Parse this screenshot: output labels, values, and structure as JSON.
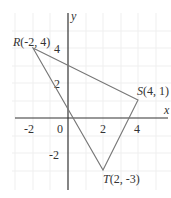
{
  "diagram": {
    "type": "coordinate-plane-triangle",
    "axes": {
      "x_label": "x",
      "y_label": "y",
      "origin_label": "0",
      "x_ticks": [
        "-2",
        "2",
        "4"
      ],
      "y_ticks": [
        "4",
        "2",
        "-2"
      ]
    },
    "points": [
      {
        "name": "R",
        "coords": "(-2, 4)",
        "x": -2,
        "y": 4
      },
      {
        "name": "S",
        "coords": "(4, 1)",
        "x": 4,
        "y": 1
      },
      {
        "name": "T",
        "coords": "(2, -3)",
        "x": 2,
        "y": -3
      }
    ],
    "colors": {
      "axis": "#333333",
      "triangle": "#777777",
      "grid": "#eeeeee"
    }
  }
}
